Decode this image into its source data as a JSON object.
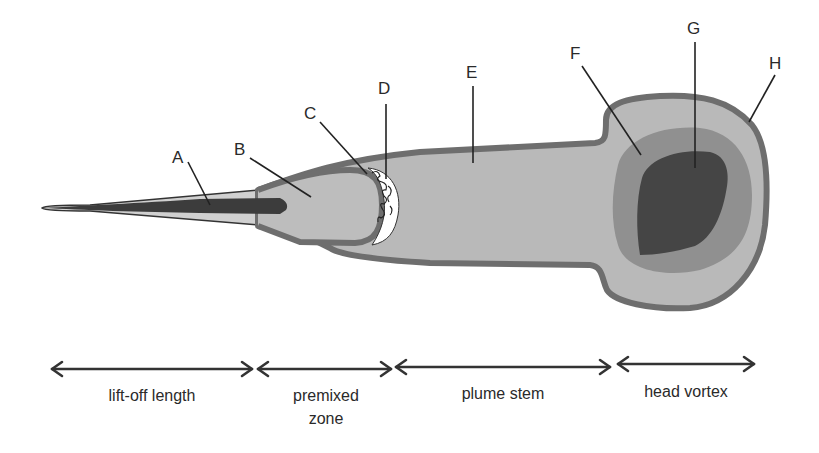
{
  "diagram": {
    "callouts": [
      {
        "id": "A",
        "label": "A"
      },
      {
        "id": "B",
        "label": "B"
      },
      {
        "id": "C",
        "label": "C"
      },
      {
        "id": "D",
        "label": "D"
      },
      {
        "id": "E",
        "label": "E"
      },
      {
        "id": "F",
        "label": "F"
      },
      {
        "id": "G",
        "label": "G"
      },
      {
        "id": "H",
        "label": "H"
      }
    ],
    "zones": [
      {
        "id": "lift-off",
        "line1": "lift-off length",
        "line2": ""
      },
      {
        "id": "premixed",
        "line1": "premixed",
        "line2": "zone"
      },
      {
        "id": "plume-stem",
        "line1": "plume stem",
        "line2": ""
      },
      {
        "id": "head-vortex",
        "line1": "head vortex",
        "line2": ""
      }
    ],
    "colors": {
      "outline": "#6e6e6e",
      "fill_light": "#b9b9b9",
      "fill_mid": "#909090",
      "core_dark": "#454545",
      "liquid_jet": "#3c3c3c",
      "background": "#ffffff"
    }
  }
}
